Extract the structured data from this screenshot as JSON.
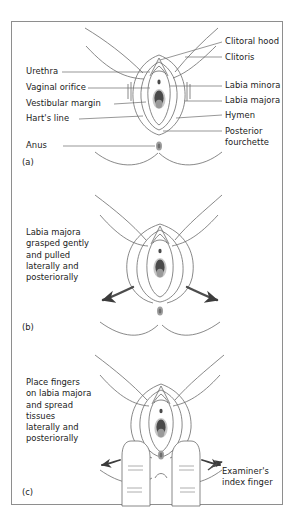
{
  "figure": {
    "background_color": "#ffffff",
    "border_color": "#8e8e8e",
    "ink_color": "#6b6b6b",
    "text_color": "#1a1a1a",
    "arrow_color": "#4d4d4d",
    "orifice_dark": "#4a4a4a",
    "orifice_mid": "#8a8a8a",
    "orifice_light": "#c8c8c8",
    "anus_color": "#9a9a9a"
  },
  "panels": [
    {
      "tag": "(a)",
      "caption": "",
      "labels_left": [
        {
          "text": "Urethra"
        },
        {
          "text": "Vaginal orifice"
        },
        {
          "text": "Vestibular margin"
        },
        {
          "text": "Hart's line"
        },
        {
          "text": "Anus"
        }
      ],
      "labels_right": [
        {
          "text": "Clitoral hood"
        },
        {
          "text": "Clitoris"
        },
        {
          "text": "Labia minora"
        },
        {
          "text": "Labia majora"
        },
        {
          "text": "Hymen"
        },
        {
          "text": "Posterior\nfourchette"
        }
      ]
    },
    {
      "tag": "(b)",
      "caption": "Labia majora grasped gently and pulled laterally and posteriorally",
      "caption_lines": [
        "Labia majora",
        "grasped gently",
        "and pulled",
        "laterally and",
        "posteriorally"
      ],
      "labels_left": [],
      "labels_right": []
    },
    {
      "tag": "(c)",
      "caption": "Place fingers on labia majora and spread tissues laterally and posteriorally",
      "caption_lines": [
        "Place fingers",
        "on labia majora",
        "and spread",
        "tissues",
        "laterally and",
        "posteriorally"
      ],
      "labels_left": [],
      "labels_right": [
        {
          "text": "Examiner's\nindex finger"
        }
      ]
    }
  ],
  "annotations": {
    "examiner_finger": "Examiner's\nindex finger",
    "posterior_fourchette": "Posterior\nfourchette"
  }
}
